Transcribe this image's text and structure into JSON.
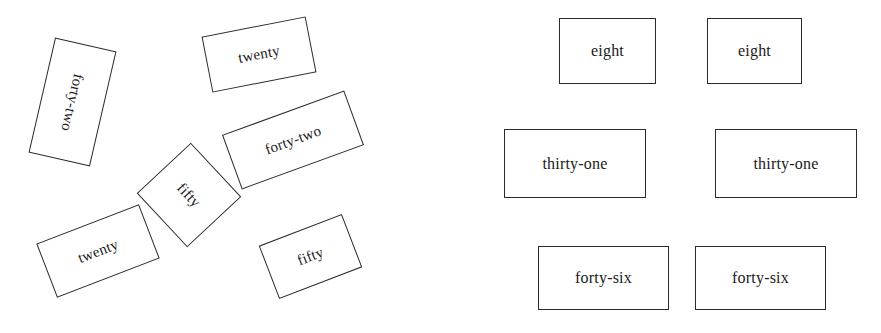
{
  "canvas": {
    "width": 881,
    "height": 333,
    "background": "#ffffff",
    "stroke_color": "#2b2b2b",
    "text_color": "#1a1a1a"
  },
  "panels": {
    "left": {
      "name": "scattered-rotated-cards",
      "cards": [
        {
          "label": "forty-two",
          "x": 41,
          "y": 43,
          "width": 63,
          "height": 118,
          "box_rotation": 13,
          "text_rotation": 90
        },
        {
          "label": "twenty",
          "x": 206,
          "y": 26,
          "width": 106,
          "height": 57,
          "box_rotation": -11,
          "text_rotation": 0
        },
        {
          "label": "forty-two",
          "x": 228,
          "y": 111,
          "width": 130,
          "height": 58,
          "box_rotation": -20,
          "text_rotation": 0
        },
        {
          "label": "fifty",
          "x": 152,
          "y": 158,
          "width": 74,
          "height": 74,
          "box_rotation": 47,
          "text_rotation": 0
        },
        {
          "label": "twenty",
          "x": 43,
          "y": 222,
          "width": 110,
          "height": 58,
          "box_rotation": -21,
          "text_rotation": 0
        },
        {
          "label": "fifty",
          "x": 266,
          "y": 228,
          "width": 89,
          "height": 57,
          "box_rotation": -21,
          "text_rotation": 0
        }
      ]
    },
    "right": {
      "name": "aligned-cards",
      "cards": [
        {
          "label": "eight",
          "x": 559,
          "y": 18,
          "width": 97,
          "height": 66,
          "box_rotation": 0,
          "text_rotation": 0
        },
        {
          "label": "eight",
          "x": 707,
          "y": 18,
          "width": 95,
          "height": 66,
          "box_rotation": 0,
          "text_rotation": 0
        },
        {
          "label": "thirty-one",
          "x": 504,
          "y": 129,
          "width": 142,
          "height": 69,
          "box_rotation": 0,
          "text_rotation": 0
        },
        {
          "label": "thirty-one",
          "x": 715,
          "y": 129,
          "width": 142,
          "height": 69,
          "box_rotation": 0,
          "text_rotation": 0
        },
        {
          "label": "forty-six",
          "x": 538,
          "y": 246,
          "width": 131,
          "height": 64,
          "box_rotation": 0,
          "text_rotation": 0
        },
        {
          "label": "forty-six",
          "x": 695,
          "y": 246,
          "width": 131,
          "height": 64,
          "box_rotation": 0,
          "text_rotation": 0
        }
      ]
    }
  }
}
